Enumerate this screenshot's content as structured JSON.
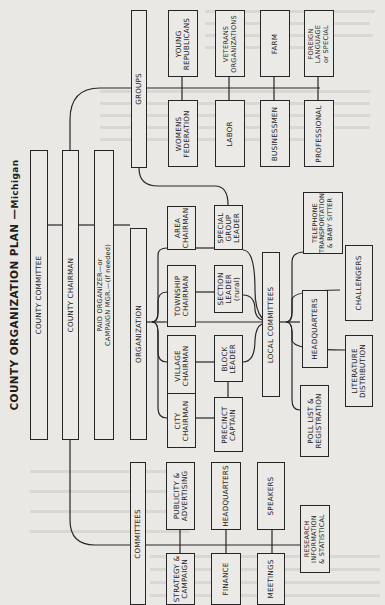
{
  "title": {
    "main": "COUNTY ORGANIZATION PLAN",
    "dash": "—",
    "state": "Michigan"
  },
  "orientation": "rotated 90° counter-clockwise (text reads bottom-to-top)",
  "spine": {
    "county_committee": "COUNTY COMMITTEE",
    "county_chairman": "COUNTY CHAIRMAN",
    "paid_organizer": "PAID ORGANIZER—or\nCAMPAIGN MGR.—(if needed)",
    "organization": "ORGANIZATION"
  },
  "groups": {
    "label": "GROUPS",
    "items": [
      {
        "label": "YOUNG\nREPUBLICANS"
      },
      {
        "label": "WOMENS\nFEDERATION"
      },
      {
        "label": "VETERANS\nORGANIZATIONS"
      },
      {
        "label": "LABOR"
      },
      {
        "label": "FARM"
      },
      {
        "label": "BUSINESSMEN"
      },
      {
        "label": "FOREIGN\nLANGUAGE\nor SPECIAL"
      },
      {
        "label": "PROFESSIONAL"
      }
    ]
  },
  "organization_branch": {
    "chairmen": [
      {
        "label": "AREA\nCHAIRMAN"
      },
      {
        "label": "TOWNSHIP\nCHAIRMAN"
      },
      {
        "label": "VILLAGE\nCHAIRMAN"
      },
      {
        "label": "CITY\nCHAIRMAN"
      }
    ],
    "leaders": [
      {
        "label": "SPECIAL\nGROUP\nLEADER"
      },
      {
        "label": "SECTION\nLEADER\n(rural)"
      },
      {
        "label": "BLOCK\nLEADER"
      },
      {
        "label": "PRECINCT\nCAPTAIN"
      }
    ]
  },
  "local_committees": {
    "label": "LOCAL COMMITTEES",
    "items": [
      {
        "label": "TELEPHONE\nTRANSPORTATION\n& BABY SITTER"
      },
      {
        "label": "CHALLENGERS"
      },
      {
        "label": "HEADQUARTERS"
      },
      {
        "label": "LITERATURE\nDISTRIBUTION"
      },
      {
        "label": "POLL LIST &\nREGISTRATION"
      }
    ]
  },
  "committees": {
    "label": "COMMITTEES",
    "items": [
      {
        "label": "PUBLICITY &\nADVERTISING"
      },
      {
        "label": "STRATEGY &\nCAMPAIGN"
      },
      {
        "label": "HEADQUARTERS"
      },
      {
        "label": "FINANCE"
      },
      {
        "label": "SPEAKERS"
      },
      {
        "label": "MEETINGS"
      },
      {
        "label": "RESEARCH\nINFORMATION\n& STATISTICAL"
      }
    ]
  },
  "colors": {
    "paper": "#e9e8e4",
    "ink": "#262626"
  }
}
